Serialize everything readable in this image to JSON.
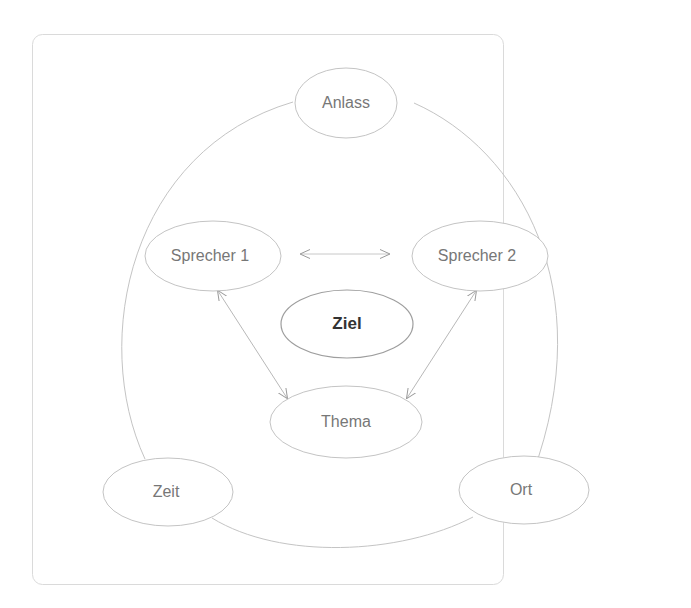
{
  "diagram": {
    "nodes": {
      "anlass": "Anlass",
      "sprecher1": "Sprecher 1",
      "sprecher2": "Sprecher 2",
      "ziel": "Ziel",
      "thema": "Thema",
      "zeit": "Zeit",
      "ort": "Ort"
    },
    "edges": [
      {
        "from": "Sprecher 1",
        "to": "Sprecher 2",
        "type": "bidirectional-arrow"
      },
      {
        "from": "Sprecher 1",
        "to": "Thema",
        "type": "bidirectional-arrow"
      },
      {
        "from": "Sprecher 2",
        "to": "Thema",
        "type": "bidirectional-arrow"
      },
      {
        "from": "Anlass",
        "to": "Ort",
        "type": "arc"
      },
      {
        "from": "Ort",
        "to": "Zeit",
        "type": "arc"
      },
      {
        "from": "Zeit",
        "to": "Anlass",
        "type": "arc"
      }
    ],
    "colors": {
      "stroke": "#bdbdbd",
      "text": "#777777",
      "emphasis_text": "#333333",
      "frame": "#d9d9d9"
    }
  }
}
